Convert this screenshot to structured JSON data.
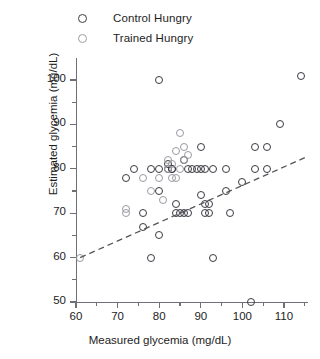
{
  "legend": {
    "position": "top-left",
    "entries": [
      {
        "label": "Control Hungry",
        "marker": "open-circle",
        "color": "#3a3a42",
        "key": "control"
      },
      {
        "label": "Trained Hungry",
        "marker": "open-circle",
        "color": "#9a9aa2",
        "key": "trained"
      }
    ]
  },
  "chart_data": {
    "type": "scatter",
    "title": "",
    "xlabel": "Measured glycemia (mg/dL)",
    "ylabel": "Estimated glycemia (mg/dL)",
    "xlim": [
      58,
      116
    ],
    "ylim": [
      50,
      104
    ],
    "grid": false,
    "xticks": [
      60,
      70,
      80,
      90,
      100,
      110
    ],
    "xticks_minor": [
      65,
      75,
      85,
      95,
      105,
      115
    ],
    "yticks": [
      50,
      60,
      70,
      80,
      90,
      100
    ],
    "yticks_minor": [
      55,
      65,
      75,
      85,
      95
    ],
    "legend_position": "top-left",
    "series": [
      {
        "name": "Control Hungry",
        "color": "#3a3a42",
        "marker": "open-circle",
        "points": [
          [
            72,
            78
          ],
          [
            74,
            80
          ],
          [
            76,
            70
          ],
          [
            76,
            67
          ],
          [
            78,
            80
          ],
          [
            78,
            60
          ],
          [
            80,
            100
          ],
          [
            80,
            80
          ],
          [
            80,
            75
          ],
          [
            80,
            65
          ],
          [
            82,
            80
          ],
          [
            82,
            81
          ],
          [
            83,
            80
          ],
          [
            83,
            80
          ],
          [
            84,
            72
          ],
          [
            84,
            70
          ],
          [
            85,
            70
          ],
          [
            86,
            70
          ],
          [
            86,
            82
          ],
          [
            87,
            70
          ],
          [
            87,
            80
          ],
          [
            88,
            80
          ],
          [
            89,
            80
          ],
          [
            90,
            80
          ],
          [
            90,
            85
          ],
          [
            90,
            74
          ],
          [
            91,
            80
          ],
          [
            91,
            72
          ],
          [
            91,
            70
          ],
          [
            92,
            72
          ],
          [
            92,
            70
          ],
          [
            93,
            80
          ],
          [
            93,
            60
          ],
          [
            96,
            80
          ],
          [
            96,
            75
          ],
          [
            97,
            70
          ],
          [
            100,
            77
          ],
          [
            102,
            50
          ],
          [
            103,
            80
          ],
          [
            103,
            85
          ],
          [
            106,
            80
          ],
          [
            106,
            85
          ],
          [
            109,
            90
          ],
          [
            114,
            101
          ]
        ]
      },
      {
        "name": "Trained Hungry",
        "color": "#9a9aa2",
        "marker": "open-circle",
        "points": [
          [
            61,
            60
          ],
          [
            72,
            71
          ],
          [
            72,
            70
          ],
          [
            76,
            78
          ],
          [
            78,
            75
          ],
          [
            80,
            78
          ],
          [
            81,
            73
          ],
          [
            82,
            80
          ],
          [
            82,
            82
          ],
          [
            83,
            81
          ],
          [
            83,
            78
          ],
          [
            84,
            84
          ],
          [
            84,
            78
          ],
          [
            85,
            88
          ],
          [
            85,
            80
          ],
          [
            86,
            82
          ],
          [
            86,
            85
          ],
          [
            87,
            83
          ]
        ]
      }
    ],
    "trendline": {
      "style": "dashed",
      "color": "#555555",
      "x_start": 61,
      "y_start": 60,
      "x_end": 115,
      "y_end": 82.5
    }
  }
}
